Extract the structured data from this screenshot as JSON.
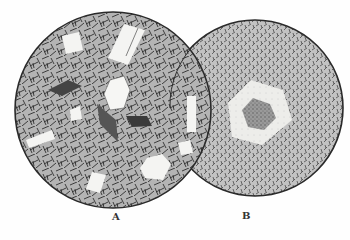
{
  "figure": {
    "panels": [
      {
        "label": "A",
        "texture": "porphyritic groundmass of needle-like crystals with scattered phenocrysts",
        "cx": 113,
        "cy": 110,
        "r": 98
      },
      {
        "label": "B",
        "texture": "fine-grained groundmass with a single hexagonal zoned phenocryst",
        "cx": 255,
        "cy": 108,
        "r": 88
      }
    ]
  },
  "colors": {
    "background": "#fefefe",
    "outline": "#2a2a2a",
    "groundmass": "#9a9a9a",
    "crystal": "#f4f4f2",
    "core": "#8a8a8a"
  }
}
